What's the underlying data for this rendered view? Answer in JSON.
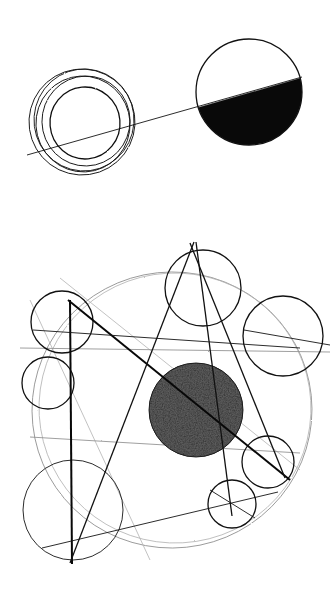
{
  "artwork": {
    "title": "Geometric Circle Composition",
    "medium": "pen and pencil on paper",
    "canvas": {
      "width": 336,
      "height": 597,
      "background": "#ffffff"
    },
    "palette": {
      "ink": "#111111",
      "solid_fill": "#090909",
      "faint_construction": "#8e8e8e",
      "ghost_construction": "#b3b3b3",
      "stipple_dark": "#3a3a3a",
      "paper": "#ffffff"
    }
  },
  "compositions": [
    {
      "id": "upper-composition",
      "name": "Concentric rings and half-filled disc",
      "elements": [
        {
          "name": "concentric-ring-cluster",
          "type": "nested-circles",
          "center": [
            82,
            122
          ],
          "rings": [
            {
              "cx": 82,
              "cy": 122,
              "rx": 53,
              "ry": 53,
              "rotate": -8
            },
            {
              "cx": 84,
              "cy": 120,
              "rx": 50,
              "ry": 51,
              "rotate": 4
            },
            {
              "cx": 83,
              "cy": 124,
              "rx": 47,
              "ry": 48,
              "rotate": -14
            },
            {
              "cx": 86,
              "cy": 121,
              "rx": 44,
              "ry": 45,
              "rotate": 10
            },
            {
              "cx": 85,
              "cy": 123,
              "rx": 35,
              "ry": 36,
              "rotate": -5
            }
          ]
        },
        {
          "name": "half-filled-disc",
          "type": "circle-with-chord-fill",
          "center": [
            249,
            92
          ],
          "radius": 53,
          "fill_side": "below-chord",
          "fill_color": "#090909"
        },
        {
          "name": "connecting-axis-line",
          "type": "line",
          "from": [
            27,
            155
          ],
          "to": [
            302,
            77
          ]
        }
      ]
    },
    {
      "id": "lower-composition",
      "name": "Orbital diagram with stippled core",
      "elements": [
        {
          "name": "outer-construction-circle",
          "type": "circle",
          "center": [
            172,
            410
          ],
          "radius": 140,
          "style": "faint"
        },
        {
          "name": "stippled-core-disc",
          "type": "textured-circle",
          "center": [
            196,
            410
          ],
          "radius": 47,
          "texture": "stipple"
        },
        {
          "name": "satellite-circle-top",
          "type": "circle",
          "center": [
            203,
            288
          ],
          "radius": 38
        },
        {
          "name": "satellite-circle-upper-left",
          "type": "circle",
          "center": [
            62,
            322
          ],
          "radius": 31
        },
        {
          "name": "satellite-circle-left-small",
          "type": "circle",
          "center": [
            48,
            383
          ],
          "radius": 26
        },
        {
          "name": "satellite-circle-right",
          "type": "circle",
          "center": [
            283,
            336
          ],
          "radius": 40
        },
        {
          "name": "satellite-circle-lower-right",
          "type": "circle",
          "center": [
            268,
            462
          ],
          "radius": 26
        },
        {
          "name": "satellite-circle-bottom-right",
          "type": "circle",
          "center": [
            232,
            504
          ],
          "radius": 24
        },
        {
          "name": "satellite-circle-bottom-left-large",
          "type": "circle",
          "center": [
            73,
            510
          ],
          "radius": 50
        },
        {
          "name": "bold-chord-upper-left-to-core",
          "type": "line",
          "from": [
            68,
            300
          ],
          "to": [
            290,
            480
          ]
        },
        {
          "name": "bold-vertical-left",
          "type": "line",
          "from": [
            70,
            300
          ],
          "to": [
            72,
            564
          ]
        },
        {
          "name": "bold-steep-line-a",
          "type": "line",
          "from": [
            194,
            242
          ],
          "to": [
            70,
            563
          ]
        },
        {
          "name": "bold-steep-line-b",
          "type": "line",
          "from": [
            196,
            242
          ],
          "to": [
            232,
            516
          ]
        },
        {
          "name": "bold-diagonal-right",
          "type": "line",
          "from": [
            190,
            243
          ],
          "to": [
            285,
            478
          ]
        },
        {
          "name": "baseline-long-edge",
          "type": "line",
          "from": [
            42,
            548
          ],
          "to": [
            278,
            492
          ]
        },
        {
          "name": "faint-traverse-upper",
          "type": "line",
          "from": [
            20,
            348
          ],
          "to": [
            330,
            352
          ]
        },
        {
          "name": "faint-traverse-lower",
          "type": "line",
          "from": [
            30,
            437
          ],
          "to": [
            300,
            453
          ]
        },
        {
          "name": "ghost-diagonal-left",
          "type": "line",
          "from": [
            30,
            300
          ],
          "to": [
            150,
            560
          ]
        }
      ]
    }
  ]
}
